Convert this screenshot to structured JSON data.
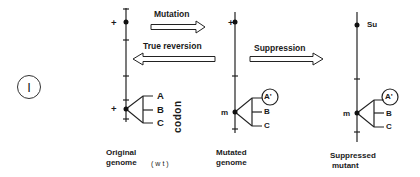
{
  "figure": {
    "panel_label": "I",
    "transitions": {
      "mutation": "Mutation",
      "true_reversion": "True reversion",
      "suppression": "Suppression"
    },
    "genomes": [
      {
        "id": "original",
        "caption_line1": "Original",
        "caption_line2": "genome",
        "tag": "(wt)",
        "top_marker": "+",
        "site_marker": "+",
        "codon_letters": [
          "A",
          "B",
          "C"
        ],
        "codon_label": "codon"
      },
      {
        "id": "mutated",
        "caption_line1": "Mutated",
        "caption_line2": "genome",
        "top_marker": "+",
        "site_marker": "m",
        "codon_letters": [
          "A'",
          "B",
          "C"
        ],
        "circled_letter": "A'"
      },
      {
        "id": "suppressed",
        "caption_line1": "Suppressed",
        "caption_line2": "mutant",
        "top_marker": "Su",
        "site_marker": "m",
        "codon_letters": [
          "A'",
          "B",
          "C"
        ],
        "circled_letter": "A'"
      }
    ]
  }
}
